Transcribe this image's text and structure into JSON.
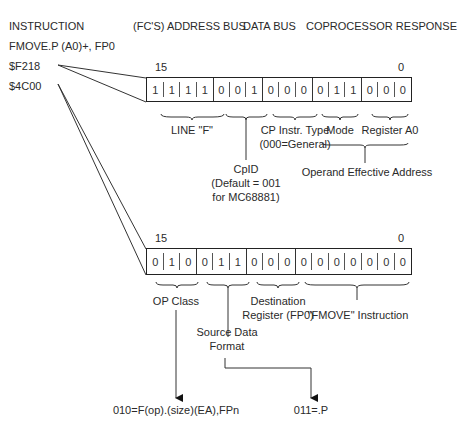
{
  "headers": {
    "instruction": "INSTRUCTION",
    "address_bus": "(FC'S) ADDRESS BUS",
    "data_bus": "DATA BUS",
    "coprocessor_response": "COPROCESSOR RESPONSE"
  },
  "instruction": {
    "mnemonic": "FMOVE.P (A0)+, FP0",
    "word1": "$F218",
    "word2": "$4C00"
  },
  "register1": {
    "msb_label": "15",
    "lsb_label": "0",
    "bits": [
      "1",
      "1",
      "1",
      "1",
      "0",
      "0",
      "1",
      "0",
      "0",
      "0",
      "0",
      "1",
      "1",
      "0",
      "0",
      "0"
    ],
    "fields": {
      "line_f": "LINE \"F\"",
      "cp_type_1": "CP Instr. Type",
      "cp_type_2": "(000=General)",
      "mode": "Mode",
      "register": "Register A0",
      "cpid_1": "CpID",
      "cpid_2": "(Default = 001",
      "cpid_3": "for MC68881)",
      "operand_ea": "Operand Effective Address"
    }
  },
  "register2": {
    "msb_label": "15",
    "lsb_label": "0",
    "bits": [
      "0",
      "1",
      "0",
      "0",
      "1",
      "1",
      "0",
      "0",
      "0",
      "0",
      "0",
      "0",
      "0",
      "0",
      "0",
      "0"
    ],
    "fields": {
      "op_class": "OP Class",
      "dest_1": "Destination",
      "dest_2": "Register (FP0)",
      "fmove": "\"FMOVE\" Instruction",
      "src_1": "Source Data",
      "src_2": "Format"
    }
  },
  "results": {
    "op_class_value": "010=F(op).(size)(EA),FPn",
    "format_value": "011=.P"
  }
}
